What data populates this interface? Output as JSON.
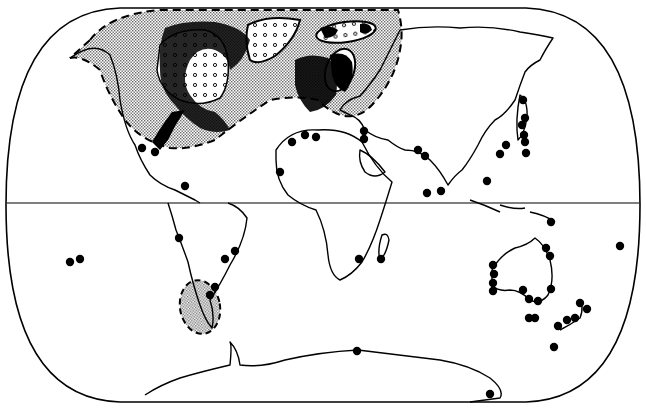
{
  "map": {
    "projection": "Eckert IV (world, equal-area)",
    "width": 646,
    "height": 410,
    "colors": {
      "background": "#ffffff",
      "ink": "#000000",
      "stipple_fill": "#bdbdbd",
      "open_dot_fill": "#ffffff"
    },
    "equator_y": 203,
    "legend": [],
    "regions": [
      {
        "name": "northern-stippled-range",
        "style": "gray-stipple, dashed boundary",
        "covers": "North America, North Atlantic, Greenland, Europe"
      },
      {
        "name": "north-america-open-dotted-area",
        "style": "white with small open dots",
        "covers": "Hudson Bay / Canada"
      },
      {
        "name": "greenland-open-dotted-area",
        "style": "white with small open dots",
        "covers": "Greenland"
      },
      {
        "name": "barents-open-dotted-ellipse",
        "style": "white with small open dots, ellipse outline",
        "covers": "Svalbard / Barents Sea"
      },
      {
        "name": "scandinavia-ellipse",
        "style": "outlined ellipse",
        "covers": "Scandinavia / Baltic"
      },
      {
        "name": "patagonia-stippled-area",
        "style": "gray-stipple, dashed boundary",
        "covers": "southern South America"
      }
    ],
    "points": [
      {
        "x": 142,
        "y": 148
      },
      {
        "x": 155,
        "y": 152
      },
      {
        "x": 185,
        "y": 186
      },
      {
        "x": 70,
        "y": 262
      },
      {
        "x": 80,
        "y": 259
      },
      {
        "x": 179,
        "y": 238
      },
      {
        "x": 225,
        "y": 259
      },
      {
        "x": 235,
        "y": 251
      },
      {
        "x": 215,
        "y": 287
      },
      {
        "x": 210,
        "y": 295
      },
      {
        "x": 280,
        "y": 172
      },
      {
        "x": 292,
        "y": 142
      },
      {
        "x": 305,
        "y": 135
      },
      {
        "x": 316,
        "y": 137
      },
      {
        "x": 364,
        "y": 131
      },
      {
        "x": 364,
        "y": 139
      },
      {
        "x": 418,
        "y": 150
      },
      {
        "x": 425,
        "y": 156
      },
      {
        "x": 427,
        "y": 193
      },
      {
        "x": 441,
        "y": 191
      },
      {
        "x": 487,
        "y": 181
      },
      {
        "x": 500,
        "y": 154
      },
      {
        "x": 506,
        "y": 145
      },
      {
        "x": 523,
        "y": 100
      },
      {
        "x": 525,
        "y": 118
      },
      {
        "x": 522,
        "y": 125
      },
      {
        "x": 524,
        "y": 135
      },
      {
        "x": 525,
        "y": 142
      },
      {
        "x": 526,
        "y": 153
      },
      {
        "x": 359,
        "y": 259
      },
      {
        "x": 381,
        "y": 259
      },
      {
        "x": 551,
        "y": 222
      },
      {
        "x": 620,
        "y": 246
      },
      {
        "x": 546,
        "y": 248
      },
      {
        "x": 550,
        "y": 256
      },
      {
        "x": 493,
        "y": 265
      },
      {
        "x": 494,
        "y": 274
      },
      {
        "x": 493,
        "y": 283
      },
      {
        "x": 493,
        "y": 291
      },
      {
        "x": 523,
        "y": 290
      },
      {
        "x": 529,
        "y": 299
      },
      {
        "x": 538,
        "y": 301
      },
      {
        "x": 551,
        "y": 289
      },
      {
        "x": 535,
        "y": 318
      },
      {
        "x": 529,
        "y": 318
      },
      {
        "x": 558,
        "y": 326
      },
      {
        "x": 567,
        "y": 320
      },
      {
        "x": 575,
        "y": 318
      },
      {
        "x": 580,
        "y": 303
      },
      {
        "x": 587,
        "y": 309
      },
      {
        "x": 554,
        "y": 347
      },
      {
        "x": 357,
        "y": 351
      },
      {
        "x": 490,
        "y": 394
      }
    ]
  }
}
